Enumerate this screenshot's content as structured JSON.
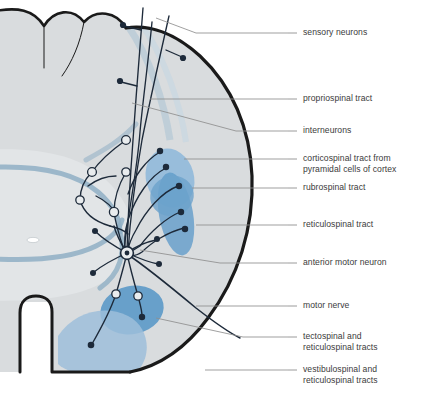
{
  "figure": {
    "colors": {
      "white_matter": "#d8dbdd",
      "gray_matter": "#dfe2e4",
      "gray_matter_band": "#8fafc4",
      "outline": "#1a1a1a",
      "corticospinal": "#93bada",
      "rubrospinal": "#6da2cc",
      "reticulospinal": "#5f9bc9",
      "tectospinal": "#4f93c6",
      "vestibulospinal": "#9dbedb",
      "neuron": "#1d2a3a",
      "leader": "#8a8a8a",
      "text": "#3b3b3b",
      "background": "#ffffff"
    }
  },
  "labels": [
    {
      "id": "sensory-neurons",
      "text": "sensory neurons",
      "x": 303,
      "y": 29,
      "tick_y": 33,
      "tick_x": 288
    },
    {
      "id": "propriospinal-tract",
      "text": "propriospinal tract",
      "x": 303,
      "y": 95,
      "tick_y": 99,
      "tick_x": 288
    },
    {
      "id": "interneurons",
      "text": "interneurons",
      "x": 303,
      "y": 127,
      "tick_y": 131,
      "tick_x": 288
    },
    {
      "id": "corticospinal-tract",
      "text": "corticospinal tract from\npyramidal cells of cortex",
      "x": 303,
      "y": 155,
      "tick_y": 159,
      "tick_x": 288
    },
    {
      "id": "rubrospinal-tract",
      "text": "rubrospinal tract",
      "x": 303,
      "y": 184,
      "tick_y": 188,
      "tick_x": 288
    },
    {
      "id": "reticulospinal-tract",
      "text": "reticulospinal tract",
      "x": 303,
      "y": 221,
      "tick_y": 225,
      "tick_x": 288
    },
    {
      "id": "anterior-motor-neuron",
      "text": "anterior motor neuron",
      "x": 303,
      "y": 259,
      "tick_y": 263,
      "tick_x": 288
    },
    {
      "id": "motor-nerve",
      "text": "motor nerve",
      "x": 303,
      "y": 302,
      "tick_y": 306,
      "tick_x": 288
    },
    {
      "id": "tectospinal-tracts",
      "text": "tectospinal and\nreticulospinal tracts",
      "x": 303,
      "y": 333,
      "tick_y": 337,
      "tick_x": 288
    },
    {
      "id": "vestibulospinal-tracts",
      "text": "vestibulospinal and\nreticulospinal tracts",
      "x": 303,
      "y": 366,
      "tick_y": 370,
      "tick_x": 288
    }
  ]
}
